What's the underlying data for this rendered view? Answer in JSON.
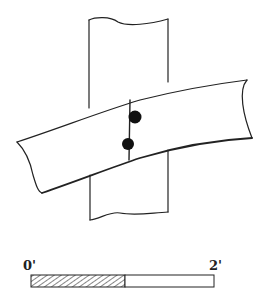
{
  "diagram": {
    "title": "",
    "elements": {
      "post": "vertical timber post",
      "beam": "inclined timber beam crossing post",
      "splice_line": "vertical joint line across beam",
      "pegs": 2
    },
    "scale_bar": {
      "start_label": "0'",
      "end_label": "2'"
    }
  }
}
